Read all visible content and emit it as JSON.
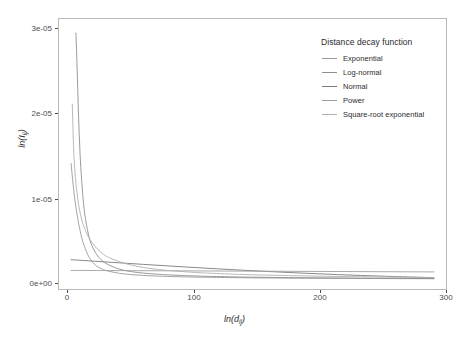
{
  "chart_data": {
    "type": "line",
    "title": "",
    "xlabel": "ln(d_ij)",
    "ylabel": "ln(I_ij)",
    "xlabel_parts": {
      "base": "ln(d",
      "sub": "ij",
      "close": ")"
    },
    "ylabel_parts": {
      "base": "ln(I",
      "sub": "ij",
      "close": ")"
    },
    "xlim": [
      -10,
      310
    ],
    "ylim": [
      -1.2e-06,
      3.15e-05
    ],
    "xticks": [
      0,
      100,
      200,
      300
    ],
    "xtick_labels": [
      "0",
      "100",
      "200",
      "300"
    ],
    "yticks": [
      0,
      1e-05,
      2e-05,
      3e-05
    ],
    "ytick_labels": [
      "0e+00",
      "1e-05",
      "2e-05",
      "3e-05"
    ],
    "grid": false,
    "legend_position": "top-right-inside",
    "legend_title": "Distance decay function",
    "series": [
      {
        "name": "Exponential",
        "color": "#9a9a9a",
        "x": [
          0,
          2,
          4,
          6,
          8,
          10,
          14,
          18,
          22,
          26,
          30,
          40,
          50,
          60,
          70,
          80,
          100,
          120,
          150,
          180,
          210,
          240,
          270,
          300
        ],
        "values": [
          1.4e-05,
          1.1e-05,
          8.7e-06,
          6.9e-06,
          5.5e-06,
          4.4e-06,
          2.9e-06,
          2e-06,
          1.5e-06,
          1.2e-06,
          1e-06,
          7e-07,
          5.4e-07,
          4.4e-07,
          3.7e-07,
          3.2e-07,
          2.5e-07,
          2e-07,
          1.5e-07,
          1.2e-07,
          9.5e-08,
          7.5e-08,
          6e-08,
          4.5e-08
        ]
      },
      {
        "name": "Log-normal",
        "color": "#8f8f8f",
        "x": [
          4,
          5,
          6,
          7,
          8,
          10,
          12,
          15,
          18,
          22,
          26,
          30,
          40,
          50,
          60,
          70,
          80,
          100,
          120,
          150,
          180,
          210,
          240,
          270,
          300
        ],
        "values": [
          2.98e-05,
          2.55e-05,
          2.05e-05,
          1.66e-05,
          1.36e-05,
          9.6e-06,
          7.2e-06,
          5e-06,
          3.8e-06,
          2.8e-06,
          2.2e-06,
          1.8e-06,
          1.2e-06,
          9e-07,
          7.2e-07,
          6e-07,
          5.1e-07,
          3.9e-07,
          3.1e-07,
          2.3e-07,
          1.8e-07,
          1.4e-07,
          1.1e-07,
          8.5e-08,
          6.5e-08
        ]
      },
      {
        "name": "Normal",
        "color": "#7a7a7a",
        "x": [
          0,
          20,
          40,
          60,
          80,
          100,
          120,
          140,
          160,
          180,
          200,
          220,
          240,
          260,
          280,
          300
        ],
        "values": [
          2.35e-06,
          2.16e-06,
          1.97e-06,
          1.78e-06,
          1.6e-06,
          1.42e-06,
          1.25e-06,
          1.09e-06,
          9.4e-07,
          8e-07,
          6.7e-07,
          5.5e-07,
          4.4e-07,
          3.4e-07,
          2.5e-07,
          1.7e-07
        ]
      },
      {
        "name": "Power",
        "color": "#9e9e9e",
        "x": [
          0,
          50,
          100,
          150,
          200,
          250,
          300
        ],
        "values": [
          1.05e-06,
          1.02e-06,
          9.9e-07,
          9.6e-07,
          9.3e-07,
          9e-07,
          8.7e-07
        ]
      },
      {
        "name": "Square-root exponential",
        "color": "#b0b0b0",
        "x": [
          1,
          2,
          3,
          4,
          6,
          8,
          10,
          14,
          18,
          22,
          26,
          30,
          40,
          50,
          60,
          70,
          80,
          100,
          120,
          150,
          180,
          210,
          240,
          270,
          300
        ],
        "values": [
          2.12e-05,
          1.62e-05,
          1.34e-05,
          1.16e-05,
          9.2e-06,
          7.7e-06,
          6.6e-06,
          5.2e-06,
          4.3e-06,
          3.6e-06,
          3.1e-06,
          2.7e-06,
          2.1e-06,
          1.7e-06,
          1.4e-06,
          1.2e-06,
          1.05e-06,
          8.3e-07,
          6.8e-07,
          5.2e-07,
          4.2e-07,
          3.4e-07,
          2.8e-07,
          2.3e-07,
          1.9e-07
        ]
      }
    ]
  },
  "axes": {
    "ytick_labels": [
      "3e-05",
      "2e-05",
      "1e-05",
      "0e+00"
    ],
    "xtick_labels": [
      "0",
      "100",
      "200",
      "300"
    ]
  },
  "legend": {
    "title": "Distance decay function",
    "items": [
      {
        "label": "Exponential"
      },
      {
        "label": "Log-normal"
      },
      {
        "label": "Normal"
      },
      {
        "label": "Power"
      },
      {
        "label": "Square-root exponential"
      }
    ]
  },
  "colors": {
    "panel_border": "#b9b9b9",
    "axis_text": "#4d4d4d",
    "title_text": "#2b2b2b",
    "background": "#ffffff"
  }
}
